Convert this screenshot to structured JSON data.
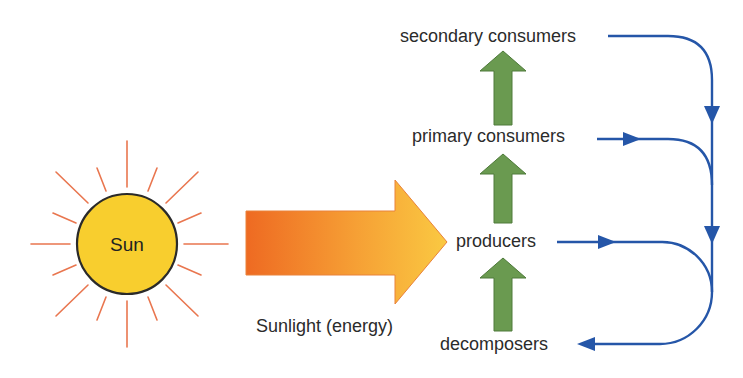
{
  "diagram": {
    "type": "energy-flow",
    "sun": {
      "label": "Sun",
      "fill_color": "#F8CE2E",
      "outline_color": "#2a2a2a",
      "ray_color": "#E9764F"
    },
    "energy_arrow": {
      "label": "Sunlight (energy)",
      "gradient_start": "#EE6A22",
      "gradient_end": "#F9C83E"
    },
    "levels": [
      {
        "id": "secondary",
        "label": "secondary consumers"
      },
      {
        "id": "primary",
        "label": "primary consumers"
      },
      {
        "id": "producers",
        "label": "producers"
      },
      {
        "id": "decomposers",
        "label": "decomposers"
      }
    ],
    "upward_arrows": {
      "color": "#6A9A50",
      "outline": "#4E7A3A",
      "connections": [
        {
          "from": "decomposers",
          "to": "producers"
        },
        {
          "from": "producers",
          "to": "primary"
        },
        {
          "from": "primary",
          "to": "secondary"
        }
      ]
    },
    "recycle_flow": {
      "color": "#2556A8",
      "connections": [
        {
          "from": "secondary",
          "to": "decomposers"
        },
        {
          "from": "primary",
          "to": "decomposers"
        },
        {
          "from": "producers",
          "to": "decomposers"
        }
      ]
    }
  }
}
